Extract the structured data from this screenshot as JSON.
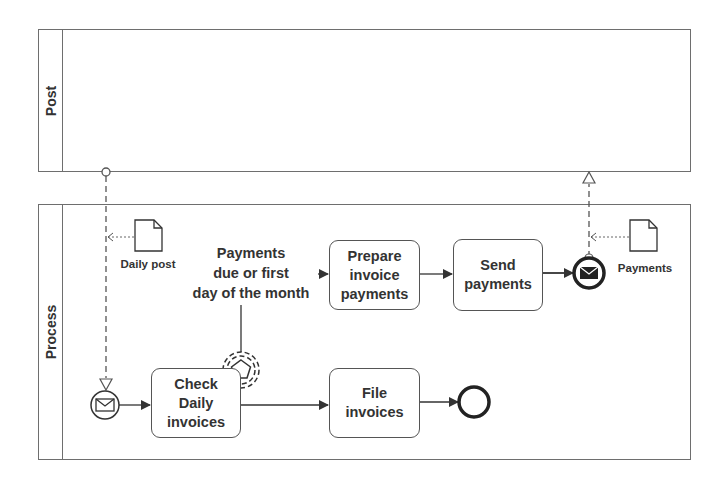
{
  "pools": {
    "post": {
      "label": "Post"
    },
    "process": {
      "label": "Process"
    }
  },
  "tasks": {
    "check_daily_invoices": "Check\nDaily\ninvoices",
    "prepare_invoice_payments": "Prepare\ninvoice\npayments",
    "send_payments": "Send\npayments",
    "file_invoices": "File\ninvoices"
  },
  "events": {
    "start": {
      "type": "message-start",
      "name": "daily-post-received"
    },
    "boundary": {
      "type": "multiple-non-interrupting-boundary",
      "label": "Payments\ndue or first\nday of the month"
    },
    "end_message": {
      "type": "message-end"
    },
    "end": {
      "type": "none-end"
    }
  },
  "data_objects": {
    "daily_post": {
      "label": "Daily post"
    },
    "payments": {
      "label": "Payments"
    }
  },
  "colors": {
    "stroke": "#333333",
    "pool_border": "#6e6e6e",
    "text": "#333333"
  }
}
